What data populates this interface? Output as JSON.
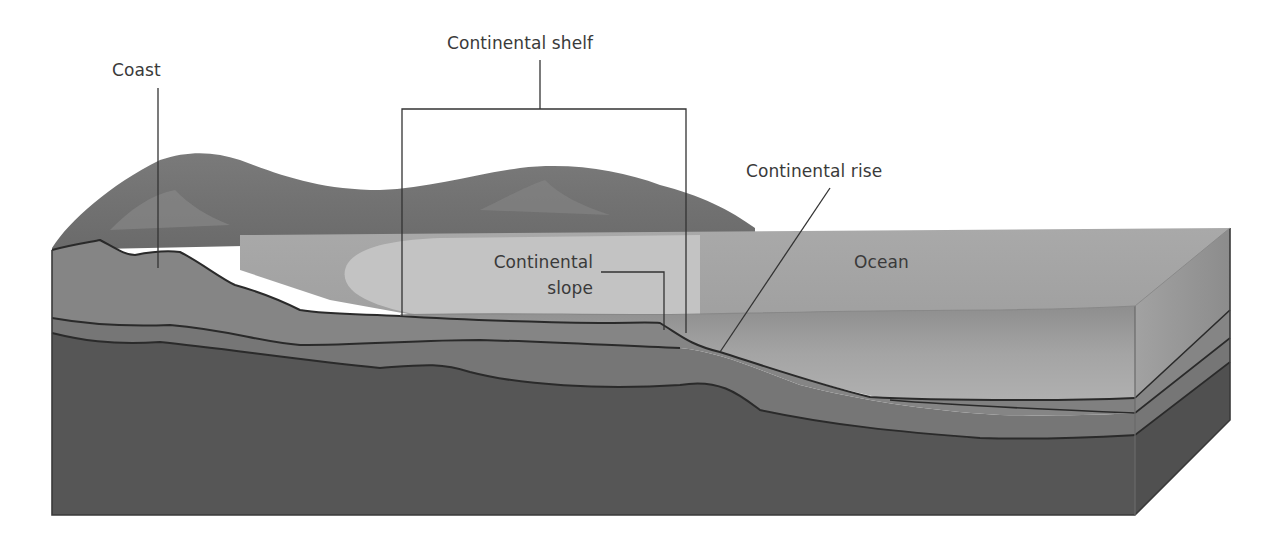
{
  "diagram": {
    "labels": {
      "coast": "Coast",
      "continental_shelf": "Continental shelf",
      "continental_rise": "Continental rise",
      "continental_slope_line1": "Continental",
      "continental_slope_line2": "slope",
      "ocean": "Ocean"
    },
    "colors": {
      "background": "#ffffff",
      "land_dark": "#6f6f6f",
      "land_light": "#8a8a8a",
      "shallow_water": "#bdbdbd",
      "ocean_surface": "#a8a8a8",
      "deep_water": "#989898",
      "sediment_upper": "#858585",
      "sediment_middle": "#767676",
      "bedrock": "#565656",
      "side_face_water": "#9a9a9a",
      "line": "#2a2a2a",
      "label_text": "#3a3a3a"
    }
  }
}
